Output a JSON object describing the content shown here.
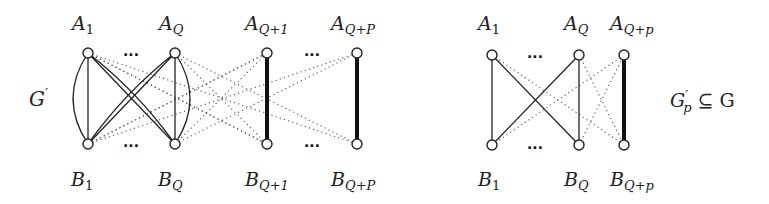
{
  "left_graph": {
    "name": "G'",
    "label_main": "G",
    "label_prime": "′",
    "top_nodes": [
      {
        "id": "A1",
        "base": "A",
        "sub": "1",
        "x": 88,
        "y": 53
      },
      {
        "id": "AQ",
        "base": "A",
        "sub": "Q",
        "x": 175,
        "y": 53
      },
      {
        "id": "AQ+1",
        "base": "A",
        "sub": "Q+1",
        "x": 267,
        "y": 53
      },
      {
        "id": "AQ+P",
        "base": "A",
        "sub": "Q+P",
        "x": 357,
        "y": 53
      }
    ],
    "bottom_nodes": [
      {
        "id": "B1",
        "base": "B",
        "sub": "1",
        "x": 88,
        "y": 144
      },
      {
        "id": "BQ",
        "base": "B",
        "sub": "Q",
        "x": 175,
        "y": 144
      },
      {
        "id": "BQ+1",
        "base": "B",
        "sub": "Q+1",
        "x": 267,
        "y": 144
      },
      {
        "id": "BQ+P",
        "base": "B",
        "sub": "Q+P",
        "x": 357,
        "y": 144
      }
    ],
    "ellipsis": "···",
    "edges": {
      "solid": [
        [
          "A1",
          "B1"
        ],
        [
          "A1",
          "BQ"
        ],
        [
          "AQ",
          "B1"
        ],
        [
          "AQ",
          "BQ"
        ]
      ],
      "double_curved": [
        [
          "A1",
          "B1"
        ],
        [
          "AQ",
          "BQ"
        ],
        [
          "A1",
          "BQ"
        ],
        [
          "AQ",
          "B1"
        ]
      ],
      "thick": [
        [
          "AQ+1",
          "BQ+1"
        ],
        [
          "AQ+P",
          "BQ+P"
        ]
      ],
      "dotted": [
        [
          "A1",
          "BQ+1"
        ],
        [
          "A1",
          "BQ+P"
        ],
        [
          "B1",
          "AQ+1"
        ],
        [
          "B1",
          "AQ+P"
        ],
        [
          "AQ",
          "BQ+1"
        ],
        [
          "AQ",
          "BQ+P"
        ],
        [
          "BQ",
          "AQ+1"
        ],
        [
          "BQ",
          "AQ+P"
        ]
      ]
    }
  },
  "right_graph": {
    "name": "G'_p ⊆ G",
    "label_main": "G",
    "label_prime": "′",
    "label_sub": "p",
    "label_rel": "⊆ G",
    "top_nodes": [
      {
        "id": "A1",
        "base": "A",
        "sub": "1",
        "x": 492,
        "y": 55
      },
      {
        "id": "AQ",
        "base": "A",
        "sub": "Q",
        "x": 579,
        "y": 55
      },
      {
        "id": "AQ+p",
        "base": "A",
        "sub": "Q+p",
        "x": 624,
        "y": 55
      }
    ],
    "bottom_nodes": [
      {
        "id": "B1",
        "base": "B",
        "sub": "1",
        "x": 492,
        "y": 145
      },
      {
        "id": "BQ",
        "base": "B",
        "sub": "Q",
        "x": 579,
        "y": 145
      },
      {
        "id": "BQ+p",
        "base": "B",
        "sub": "Q+p",
        "x": 624,
        "y": 145
      }
    ],
    "ellipsis": "···",
    "edges": {
      "solid": [
        [
          "A1",
          "B1"
        ],
        [
          "A1",
          "BQ"
        ],
        [
          "AQ",
          "B1"
        ],
        [
          "AQ",
          "BQ"
        ]
      ],
      "thick": [
        [
          "AQ+p",
          "BQ+p"
        ]
      ],
      "dotted": [
        [
          "A1",
          "BQ+p"
        ],
        [
          "B1",
          "AQ+p"
        ],
        [
          "AQ",
          "BQ+p"
        ],
        [
          "BQ",
          "AQ+p"
        ]
      ]
    }
  }
}
